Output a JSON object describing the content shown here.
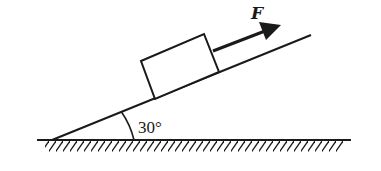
{
  "diagram": {
    "type": "physics-incline",
    "force_label": "F",
    "angle_label": "30°",
    "angle_degrees": 30,
    "colors": {
      "stroke": "#1a1a1a",
      "background": "#ffffff"
    },
    "elements": {
      "ground": "horizontal ground line with hatching",
      "incline": "inclined plane at 30 degrees",
      "block": "rectangular block resting on incline",
      "force_arrow": "force F applied parallel to incline, pointing up the slope",
      "angle_arc": "arc marking the 30 degree angle between incline and ground"
    }
  }
}
